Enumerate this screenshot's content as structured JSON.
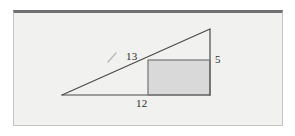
{
  "figure": {
    "frame": {
      "background_color": "#f1f1f0",
      "top_border_color": "#6e7072",
      "side_border_color": "#c3c3c3"
    },
    "colors": {
      "stroke": "#4a4a4a",
      "rectangle_fill": "#d9d9d9",
      "rectangle_stroke": "#8a8a8a",
      "label_text": "#2b2b2b",
      "tick_mark": "#b9b9b9"
    },
    "labels": {
      "hypotenuse": "13",
      "vertical_leg": "5",
      "horizontal_leg": "12"
    },
    "geometry": {
      "triangle": {
        "left_vertex": [
          62,
          95
        ],
        "right_angle_vertex": [
          210,
          95
        ],
        "apex": [
          210,
          29
        ]
      },
      "rectangle": {
        "left": 148,
        "top": 60,
        "right": 210,
        "bottom": 95
      },
      "hypotenuse_tick": {
        "from": [
          108,
          62
        ],
        "to": [
          116,
          53
        ]
      }
    }
  }
}
